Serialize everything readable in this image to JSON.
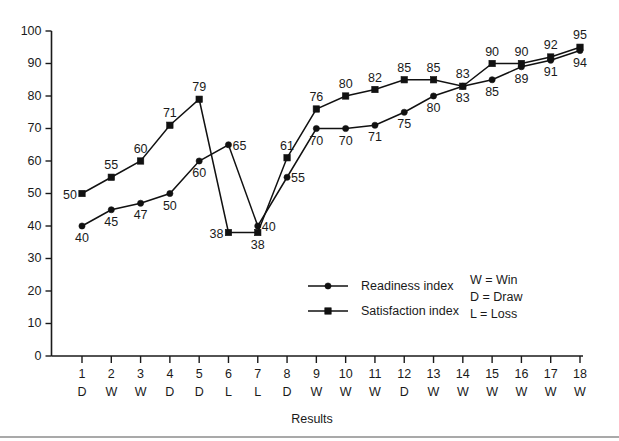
{
  "chart_data": {
    "type": "line",
    "title": "",
    "subtitle": "",
    "xlabel": "Results",
    "ylabel": "",
    "ylim": [
      0,
      100
    ],
    "ytick_labels": [
      "0",
      "10",
      "20",
      "30",
      "40",
      "50",
      "60",
      "70",
      "80",
      "90",
      "100"
    ],
    "ytick_values": [
      0,
      10,
      20,
      30,
      40,
      50,
      60,
      70,
      80,
      90,
      100
    ],
    "grid": false,
    "legend_position": "inside-bottom-center",
    "x": [
      1,
      2,
      3,
      4,
      5,
      6,
      7,
      8,
      9,
      10,
      11,
      12,
      13,
      14,
      15,
      16,
      17,
      18
    ],
    "categories": [
      "1",
      "2",
      "3",
      "4",
      "5",
      "6",
      "7",
      "8",
      "9",
      "10",
      "11",
      "12",
      "13",
      "14",
      "15",
      "16",
      "17",
      "18"
    ],
    "category_results": [
      "D",
      "W",
      "W",
      "D",
      "D",
      "L",
      "L",
      "D",
      "W",
      "W",
      "W",
      "D",
      "W",
      "W",
      "W",
      "W",
      "W",
      "W"
    ],
    "series": [
      {
        "name": "Readiness index",
        "marker": "circle",
        "values": [
          40,
          45,
          47,
          50,
          60,
          65,
          40,
          55,
          70,
          70,
          71,
          75,
          80,
          83,
          85,
          89,
          91,
          94
        ]
      },
      {
        "name": "Satisfaction index",
        "marker": "square",
        "values": [
          50,
          55,
          60,
          71,
          79,
          38,
          38,
          61,
          76,
          80,
          82,
          85,
          85,
          83,
          90,
          90,
          92,
          95
        ]
      }
    ]
  },
  "legend": {
    "entries": [
      {
        "label": "Readiness index",
        "marker": "circle"
      },
      {
        "label": "Satisfaction index",
        "marker": "square"
      }
    ]
  },
  "key": {
    "lines": [
      "W = Win",
      "D = Draw",
      "L = Loss"
    ]
  },
  "axis": {
    "xlabel": "Results"
  }
}
